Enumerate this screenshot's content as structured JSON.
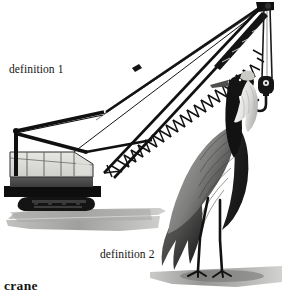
{
  "page": {
    "headword": "crane",
    "background_color": "#ffffff",
    "text_color": "#141414",
    "width": 282,
    "height": 301
  },
  "labels": {
    "definition_1": "definition 1",
    "definition_2": "definition 2"
  },
  "illustration": {
    "title": "crane-illustration",
    "caption_word": "crane",
    "figures": [
      {
        "name": "crawler-crane",
        "label": "definition 1",
        "description": "Construction lattice-boom crawler crane with operator cab, track treads, hoist cables and hanging hook block",
        "parts": [
          "lattice-boom",
          "boom-tip-sheave",
          "hook-block",
          "hook",
          "hoist-cable",
          "pendant-cable",
          "gantry-a-frame",
          "operator-cab",
          "cab-windows",
          "crawler-track",
          "ground-shadow"
        ]
      },
      {
        "name": "crane-bird",
        "label": "definition 2",
        "description": "Tall wading crane bird standing, long neck, dark plumage with grey wing feathers, long thin legs",
        "parts": [
          "beak",
          "head",
          "crown-patch",
          "neck-plume",
          "neck",
          "wing-feathers",
          "tail-plumes",
          "legs",
          "feet",
          "ground-shadow"
        ]
      }
    ],
    "colors": {
      "ink_black": "#111111",
      "cab_window_grey": "#d9d9d6",
      "cab_body_grey": "#4a4a4a",
      "shadow_grey": "#9a9a98",
      "feather_grey": "#8d8d8b",
      "plume_white": "#efefed"
    }
  }
}
